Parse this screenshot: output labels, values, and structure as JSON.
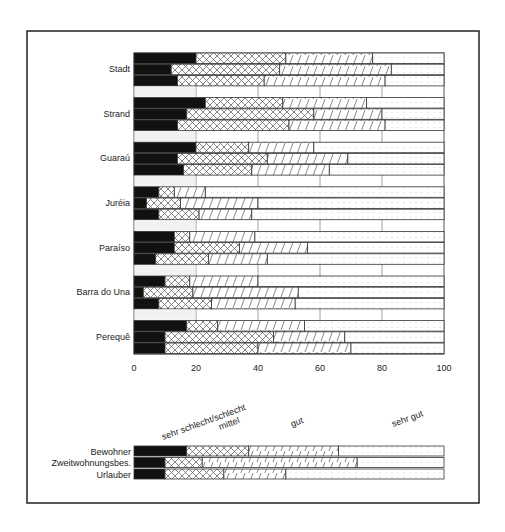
{
  "chart_data": [
    {
      "type": "bar",
      "orientation": "horizontal",
      "stacked": true,
      "percent": true,
      "title": "",
      "xlabel": "",
      "ylabel": "",
      "xlim": [
        0,
        100
      ],
      "x_ticks": [
        "0",
        "20",
        "40",
        "60",
        "80",
        "100"
      ],
      "grid": "vertical gridlines at 20, 40, 60, 80 (visible in gaps between groups)",
      "categories": [
        "Stadt",
        "Strand",
        "Guaraú",
        "Juréia",
        "Paraíso",
        "Barra do Una",
        "Perequê"
      ],
      "bars_per_category": [
        "Bewohner",
        "Zweitwohnungsbes.",
        "Urlauber"
      ],
      "segment_order": [
        "sehr schlecht/schlecht",
        "mittel",
        "gut",
        "sehr gut"
      ],
      "groups": [
        {
          "category": "Stadt",
          "rows": [
            {
              "name": "Bewohner",
              "values": [
                20,
                29,
                28,
                23
              ]
            },
            {
              "name": "Zweitwohnungsbes.",
              "values": [
                12,
                35,
                36,
                17
              ]
            },
            {
              "name": "Urlauber",
              "values": [
                14,
                28,
                39,
                19
              ]
            }
          ]
        },
        {
          "category": "Strand",
          "rows": [
            {
              "name": "Bewohner",
              "values": [
                23,
                25,
                27,
                25
              ]
            },
            {
              "name": "Zweitwohnungsbes.",
              "values": [
                17,
                41,
                22,
                20
              ]
            },
            {
              "name": "Urlauber",
              "values": [
                14,
                36,
                31,
                19
              ]
            }
          ]
        },
        {
          "category": "Guaraú",
          "rows": [
            {
              "name": "Bewohner",
              "values": [
                20,
                17,
                21,
                42
              ]
            },
            {
              "name": "Zweitwohnungsbes.",
              "values": [
                14,
                29,
                26,
                31
              ]
            },
            {
              "name": "Urlauber",
              "values": [
                16,
                22,
                25,
                37
              ]
            }
          ]
        },
        {
          "category": "Juréia",
          "rows": [
            {
              "name": "Bewohner",
              "values": [
                8,
                5,
                10,
                77
              ]
            },
            {
              "name": "Zweitwohnungsbes.",
              "values": [
                4,
                11,
                25,
                60
              ]
            },
            {
              "name": "Urlauber",
              "values": [
                8,
                13,
                17,
                62
              ]
            }
          ]
        },
        {
          "category": "Paraíso",
          "rows": [
            {
              "name": "Bewohner",
              "values": [
                13,
                5,
                21,
                61
              ]
            },
            {
              "name": "Zweitwohnungsbes.",
              "values": [
                13,
                21,
                22,
                44
              ]
            },
            {
              "name": "Urlauber",
              "values": [
                7,
                17,
                19,
                57
              ]
            }
          ]
        },
        {
          "category": "Barra do Una",
          "rows": [
            {
              "name": "Bewohner",
              "values": [
                10,
                8,
                22,
                60
              ]
            },
            {
              "name": "Zweitwohnungsbes.",
              "values": [
                3,
                16,
                34,
                47
              ]
            },
            {
              "name": "Urlauber",
              "values": [
                8,
                17,
                27,
                48
              ]
            }
          ]
        },
        {
          "category": "Perequê",
          "rows": [
            {
              "name": "Bewohner",
              "values": [
                17,
                10,
                28,
                45
              ]
            },
            {
              "name": "Zweitwohnungsbes.",
              "values": [
                10,
                35,
                23,
                32
              ]
            },
            {
              "name": "Urlauber",
              "values": [
                10,
                30,
                30,
                30
              ]
            }
          ]
        }
      ]
    },
    {
      "type": "bar",
      "orientation": "horizontal",
      "stacked": true,
      "role": "legend / overall summary",
      "legend_entries": [
        "sehr schlecht/schlecht",
        "mittel",
        "gut",
        "sehr gut"
      ],
      "categories": [
        "Bewohner",
        "Zweitwohnungsbes.",
        "Urlauber"
      ],
      "series": [
        {
          "name": "Bewohner",
          "values": [
            17,
            20,
            29,
            34
          ]
        },
        {
          "name": "Zweitwohnungsbes.",
          "values": [
            10,
            12,
            50,
            28
          ]
        },
        {
          "name": "Urlauber",
          "values": [
            10,
            19,
            20,
            51
          ]
        }
      ]
    }
  ],
  "legend": {
    "labels": [
      "sehr schlecht/schlecht",
      "mittel",
      "gut",
      "sehr gut"
    ],
    "patterns": [
      "solid-black",
      "crosshatch",
      "diagonal-hatch",
      "dots"
    ]
  },
  "colors": {
    "frame": "#222222",
    "bar_outline": "#333333",
    "solid": "#111111",
    "pattern_line": "#555555",
    "dots": "#9a9a9a",
    "grid": "#888888",
    "background": "#ffffff"
  }
}
